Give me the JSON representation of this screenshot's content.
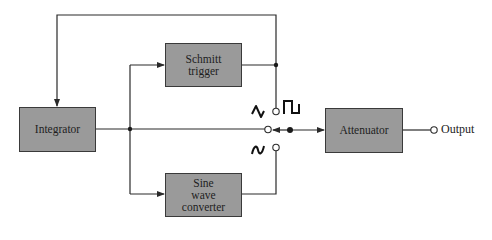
{
  "diagram": {
    "type": "block-diagram",
    "title": "",
    "blocks": [
      {
        "id": "integrator",
        "label": "Integrator"
      },
      {
        "id": "schmitt",
        "label": "Schmitt\ntrigger"
      },
      {
        "id": "sine",
        "label": "Sine\nwave\nconverter"
      },
      {
        "id": "attenuator",
        "label": "Attenuator"
      }
    ],
    "output_label": "Output",
    "switch": {
      "positions": [
        {
          "id": "triangle",
          "waveform_icon": "triangle-wave"
        },
        {
          "id": "square",
          "waveform_icon": "square-wave"
        },
        {
          "id": "sine",
          "waveform_icon": "sine-wave"
        }
      ]
    },
    "connections": [
      {
        "from": "integrator",
        "to": "schmitt"
      },
      {
        "from": "integrator",
        "to": "sine"
      },
      {
        "from": "schmitt",
        "to": "integrator",
        "kind": "feedback"
      },
      {
        "from": "schmitt",
        "to": "switch.square"
      },
      {
        "from": "integrator",
        "to": "switch.triangle"
      },
      {
        "from": "sine",
        "to": "switch.sine"
      },
      {
        "from": "switch",
        "to": "attenuator"
      },
      {
        "from": "attenuator",
        "to": "output"
      }
    ],
    "colors": {
      "block_fill": "#9a9a9a",
      "line": "#2a2a2a"
    }
  }
}
